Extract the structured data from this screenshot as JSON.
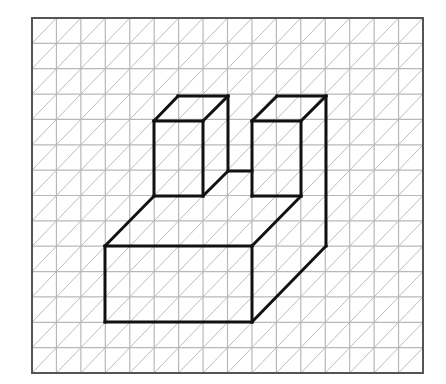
{
  "figure": {
    "type": "isometric-grid-drawing",
    "grid": {
      "left": 32,
      "top": 18,
      "right": 423,
      "bottom": 373,
      "cols": 16,
      "rows": 14,
      "line_color": "#b8b8b8",
      "border_color": "#555555"
    },
    "edge_color": "#111111",
    "edges": [
      [
        105,
        246,
        252,
        246
      ],
      [
        252,
        246,
        252,
        322
      ],
      [
        252,
        322,
        105,
        322
      ],
      [
        105,
        322,
        105,
        246
      ],
      [
        105,
        246,
        154,
        196
      ],
      [
        154,
        196,
        203,
        196
      ],
      [
        154,
        121,
        203,
        121
      ],
      [
        203,
        121,
        203,
        196
      ],
      [
        154,
        121,
        154,
        196
      ],
      [
        154,
        121,
        178,
        96
      ],
      [
        178,
        96,
        228,
        96
      ],
      [
        203,
        121,
        228,
        96
      ],
      [
        228,
        96,
        228,
        171
      ],
      [
        203,
        196,
        228,
        171
      ],
      [
        228,
        171,
        252,
        171
      ],
      [
        252,
        121,
        301,
        121
      ],
      [
        301,
        121,
        301,
        196
      ],
      [
        301,
        196,
        252,
        196
      ],
      [
        252,
        121,
        252,
        196
      ],
      [
        252,
        121,
        277,
        96
      ],
      [
        277,
        96,
        326,
        96
      ],
      [
        301,
        121,
        326,
        96
      ],
      [
        326,
        96,
        326,
        246
      ],
      [
        301,
        196,
        252,
        246
      ],
      [
        326,
        246,
        252,
        322
      ]
    ]
  }
}
